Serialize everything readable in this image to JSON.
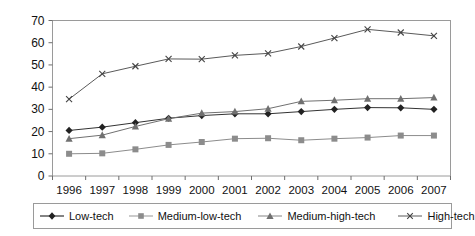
{
  "chart_data": {
    "type": "line",
    "title": "",
    "subtitle": "",
    "xlabel": "",
    "ylabel": "",
    "categories": [
      "1996",
      "1997",
      "1998",
      "1999",
      "2000",
      "2001",
      "2002",
      "2003",
      "2004",
      "2005",
      "2006",
      "2007"
    ],
    "x": [
      1996,
      1997,
      1998,
      1999,
      2000,
      2001,
      2002,
      2003,
      2004,
      2005,
      2006,
      2007
    ],
    "ylim": [
      0,
      70
    ],
    "yticks": [
      0,
      10,
      20,
      30,
      40,
      50,
      60,
      70
    ],
    "grid": false,
    "legend_position": "bottom",
    "series": [
      {
        "name": "Low-tech",
        "marker": "diamond",
        "color": "#333333",
        "values": [
          20.5,
          22.0,
          24.0,
          26.0,
          27.2,
          28.0,
          28.0,
          29.0,
          30.0,
          30.8,
          30.7,
          30.0
        ]
      },
      {
        "name": "Medium-low-tech",
        "marker": "square",
        "color": "#8c8c8c",
        "values": [
          10.0,
          10.2,
          12.0,
          14.0,
          15.3,
          16.8,
          17.0,
          16.1,
          16.8,
          17.3,
          18.2,
          18.2
        ]
      },
      {
        "name": "Medium-high-tech",
        "marker": "triangle",
        "color": "#707070",
        "values": [
          16.8,
          18.4,
          22.3,
          25.8,
          28.3,
          29.0,
          30.3,
          33.6,
          34.1,
          34.8,
          34.8,
          35.3
        ]
      },
      {
        "name": "High-tech",
        "marker": "cross",
        "color": "#5a5a5a",
        "values": [
          34.6,
          46.0,
          49.4,
          52.7,
          52.6,
          54.3,
          55.2,
          58.3,
          62.1,
          66.0,
          64.6,
          63.1
        ]
      }
    ]
  },
  "axes": {
    "y_tick_labels": [
      "70",
      "60",
      "50",
      "40",
      "30",
      "20",
      "10",
      "0"
    ],
    "x_tick_labels": [
      "1996",
      "1997",
      "1998",
      "1999",
      "2000",
      "2001",
      "2002",
      "2003",
      "2004",
      "2005",
      "2006",
      "2007"
    ]
  },
  "legend": {
    "items": [
      {
        "label": "Low-tech",
        "marker": "diamond",
        "color": "#333333"
      },
      {
        "label": "Medium-low-tech",
        "marker": "square",
        "color": "#8c8c8c"
      },
      {
        "label": "Medium-high-tech",
        "marker": "triangle",
        "color": "#707070"
      },
      {
        "label": "High-tech",
        "marker": "cross",
        "color": "#5a5a5a"
      }
    ]
  },
  "colors": {
    "plot_border": "#9a9a9a",
    "axis": "#6e6e6e",
    "background": "#ffffff",
    "text": "#111111"
  }
}
